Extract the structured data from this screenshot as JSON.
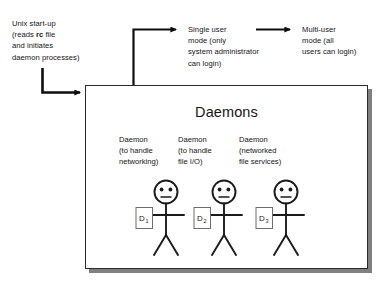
{
  "diagram": {
    "stages": [
      {
        "id": "unix-startup",
        "text": "Unix start-up\n(reads rc file\nand initiates\ndaemon processes)",
        "line1": "Unix start-up",
        "line2_pre": "(reads ",
        "line2_bold": "rc",
        "line2_post": " file",
        "line3": "and initiates",
        "line4": "daemon processes)"
      },
      {
        "id": "single-user-mode",
        "text": "Single user\nmode (only\nsystem administrator\ncan login)"
      },
      {
        "id": "multi-user-mode",
        "text": "Multi-user\nmode (all\nusers can login)"
      }
    ],
    "panel": {
      "title": "Daemons",
      "columns": [
        {
          "label": "Daemon\n(to handle\nnetworking)",
          "badge": "D",
          "badge_sub": "1"
        },
        {
          "label": "Daemon\n(to handle\nfile I/O)",
          "badge": "D",
          "badge_sub": "2"
        },
        {
          "label": "Daemon\n(networked\nfile services)",
          "badge": "D",
          "badge_sub": "3"
        }
      ]
    },
    "colors": {
      "ink": "#141414",
      "stroke": "#1a1a1a",
      "panel_border": "#2b2b2b",
      "panel_fill": "#ffffff",
      "shadow": "#808080",
      "background": "#ffffff"
    }
  }
}
